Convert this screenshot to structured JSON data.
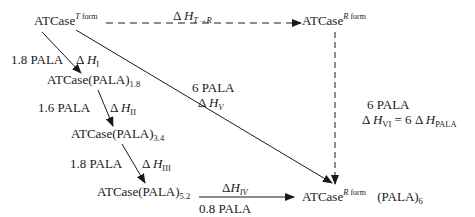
{
  "nodes": {
    "t_form": {
      "base": "ATCase",
      "sup_italic": "T",
      "sup_text": "form"
    },
    "r_form": {
      "base": "ATCase",
      "sup_italic": "R",
      "sup_text": "form"
    },
    "pala_1_8": {
      "base": "ATCase(PALA)",
      "sub": "1.8"
    },
    "pala_3_4": {
      "base": "ATCase(PALA)",
      "sub": "3.4"
    },
    "pala_5_2": {
      "base": "ATCase(PALA)",
      "sub": "5.2"
    },
    "r_form_pala6": {
      "base": "ATCase",
      "sup_italic": "R",
      "sup_text": "form",
      "suffix": "(PALA)",
      "suffix_sub": "6"
    }
  },
  "edges": {
    "t_to_r": {
      "delta": "Δ",
      "h": "H",
      "sub": "T→R",
      "style": "dashed"
    },
    "step1": {
      "amount": "1.8 PALA",
      "delta": "Δ",
      "h": "H",
      "sub": "I"
    },
    "step2": {
      "amount": "1.6 PALA",
      "delta": "Δ",
      "h": "H",
      "sub": "II"
    },
    "step3": {
      "amount": "1.8 PALA",
      "delta": "Δ",
      "h": "H",
      "sub": "III"
    },
    "step4": {
      "amount": "0.8 PALA",
      "delta": "Δ",
      "h": "H",
      "sub": "IV"
    },
    "direct": {
      "amount": "6 PALA",
      "delta": "Δ",
      "h": "H",
      "sub": "V"
    },
    "r_binding": {
      "amount": "6 PALA",
      "delta": "Δ",
      "h": "H",
      "sub": "VI",
      "equals": "= 6",
      "delta2": "Δ",
      "h2": "H",
      "sub2": "PALA",
      "style": "dashed"
    }
  }
}
